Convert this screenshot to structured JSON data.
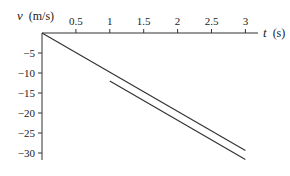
{
  "chart_data": {
    "type": "line",
    "title": "",
    "xlabel": "t (s)",
    "ylabel": "v (m/s)",
    "xlabel_var": "t",
    "xlabel_unit": "(s)",
    "ylabel_var": "v",
    "ylabel_unit": "(m/s)",
    "xlim": [
      0,
      3
    ],
    "ylim": [
      -32,
      0
    ],
    "x_ticks": [
      0.5,
      1,
      1.5,
      2,
      2.5,
      3
    ],
    "x_tick_labels": [
      "0.5",
      "1",
      "1.5",
      "2",
      "2.5",
      "3"
    ],
    "y_ticks": [
      -5,
      -10,
      -15,
      -20,
      -25,
      -30
    ],
    "y_tick_labels": [
      "−5",
      "−10",
      "−15",
      "−20",
      "−25",
      "−30"
    ],
    "grid": false,
    "legend": null,
    "series": [
      {
        "name": "line-1",
        "x": [
          0,
          3
        ],
        "y": [
          0,
          -29.4
        ],
        "color": "#333333"
      },
      {
        "name": "line-2",
        "x": [
          1,
          3
        ],
        "y": [
          -12,
          -31.6
        ],
        "color": "#333333"
      }
    ]
  }
}
